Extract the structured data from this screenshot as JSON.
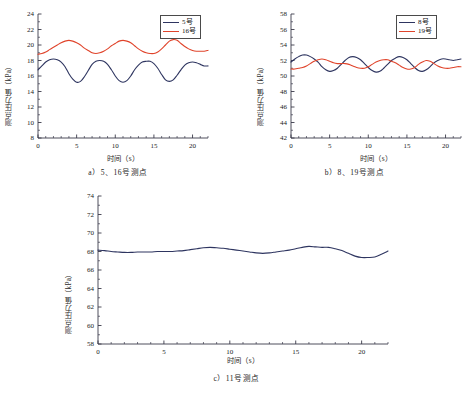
{
  "figure": {
    "ylabel": "测点压力值（kPa）",
    "xlabel": "时间（s）"
  },
  "charts": [
    {
      "id": "a",
      "caption": "a）5、16号测点",
      "ylabel": "测点压力值（kPa）",
      "xlabel": "时间（s）",
      "yticks": [
        "8",
        "10",
        "12",
        "14",
        "16",
        "18",
        "20",
        "22",
        "24"
      ],
      "xticks": [
        "0",
        "5",
        "10",
        "15",
        "20"
      ],
      "legend": [
        {
          "label": "5号",
          "color": "#2e3560"
        },
        {
          "label": "16号",
          "color": "#e0442b"
        }
      ]
    },
    {
      "id": "b",
      "caption": "b）8、19号测点",
      "ylabel": "测点压力值（kPa）",
      "xlabel": "时间（s）",
      "yticks": [
        "42",
        "44",
        "46",
        "48",
        "50",
        "52",
        "54",
        "56",
        "58"
      ],
      "xticks": [
        "0",
        "5",
        "10",
        "15",
        "20"
      ],
      "legend": [
        {
          "label": "8号",
          "color": "#2e3560"
        },
        {
          "label": "19号",
          "color": "#e0442b"
        }
      ]
    },
    {
      "id": "c",
      "caption": "c）11号测点",
      "ylabel": "测点压力值（kPa）",
      "xlabel": "时间（s）",
      "yticks": [
        "58",
        "60",
        "62",
        "64",
        "66",
        "68",
        "70",
        "72",
        "74"
      ],
      "xticks": [
        "0",
        "5",
        "10",
        "15",
        "20"
      ],
      "legend": []
    }
  ],
  "chart_data": [
    {
      "type": "line",
      "id": "a",
      "title": "a）5、16号测点",
      "xlabel": "时间（s）",
      "ylabel": "测点压力值（kPa）",
      "xlim": [
        0,
        22
      ],
      "ylim": [
        8,
        24
      ],
      "ytick_step": 2,
      "xticks": [
        0,
        5,
        10,
        15,
        20
      ],
      "grid": false,
      "legend_position": "top-right",
      "x": [
        0,
        0.5,
        1,
        1.5,
        2,
        2.5,
        3,
        3.5,
        4,
        4.5,
        5,
        5.5,
        6,
        6.5,
        7,
        7.5,
        8,
        8.5,
        9,
        9.5,
        10,
        10.5,
        11,
        11.5,
        12,
        12.5,
        13,
        13.5,
        14,
        14.5,
        15,
        15.5,
        16,
        16.5,
        17,
        17.5,
        18,
        18.5,
        19,
        19.5,
        20,
        20.5,
        21,
        21.5,
        22
      ],
      "series": [
        {
          "name": "5号",
          "color": "#2e3560",
          "values": [
            16.8,
            17.3,
            17.8,
            18.1,
            18.2,
            18.1,
            17.8,
            17.2,
            16.3,
            15.6,
            15.2,
            15.3,
            15.9,
            16.7,
            17.5,
            17.9,
            18.0,
            17.9,
            17.5,
            16.8,
            16.0,
            15.4,
            15.2,
            15.4,
            16.0,
            16.8,
            17.4,
            17.8,
            17.9,
            17.9,
            17.6,
            17.0,
            16.2,
            15.5,
            15.3,
            15.5,
            16.1,
            16.8,
            17.4,
            17.7,
            17.8,
            17.7,
            17.5,
            17.3,
            17.3
          ]
        },
        {
          "name": "16号",
          "color": "#e0442b",
          "values": [
            18.8,
            18.9,
            19.1,
            19.4,
            19.7,
            20.0,
            20.3,
            20.5,
            20.6,
            20.5,
            20.3,
            20.0,
            19.6,
            19.3,
            19.0,
            18.9,
            19.0,
            19.2,
            19.5,
            19.9,
            20.2,
            20.5,
            20.6,
            20.5,
            20.3,
            19.9,
            19.5,
            19.2,
            19.0,
            18.9,
            18.9,
            19.1,
            19.5,
            20.0,
            20.5,
            20.7,
            20.6,
            20.2,
            19.8,
            19.5,
            19.3,
            19.2,
            19.2,
            19.2,
            19.3
          ]
        }
      ]
    },
    {
      "type": "line",
      "id": "b",
      "title": "b）8、19号测点",
      "xlabel": "时间（s）",
      "ylabel": "测点压力值（kPa）",
      "xlim": [
        0,
        22
      ],
      "ylim": [
        42,
        58
      ],
      "ytick_step": 2,
      "xticks": [
        0,
        5,
        10,
        15,
        20
      ],
      "grid": false,
      "legend_position": "top-right",
      "x": [
        0,
        0.5,
        1,
        1.5,
        2,
        2.5,
        3,
        3.5,
        4,
        4.5,
        5,
        5.5,
        6,
        6.5,
        7,
        7.5,
        8,
        8.5,
        9,
        9.5,
        10,
        10.5,
        11,
        11.5,
        12,
        12.5,
        13,
        13.5,
        14,
        14.5,
        15,
        15.5,
        16,
        16.5,
        17,
        17.5,
        18,
        18.5,
        19,
        19.5,
        20,
        20.5,
        21,
        21.5,
        22
      ],
      "series": [
        {
          "name": "8号",
          "color": "#2e3560",
          "values": [
            51.8,
            52.2,
            52.5,
            52.7,
            52.7,
            52.5,
            52.2,
            51.8,
            51.2,
            50.8,
            50.6,
            50.7,
            51.0,
            51.5,
            52.0,
            52.4,
            52.5,
            52.4,
            52.1,
            51.6,
            51.1,
            50.7,
            50.5,
            50.6,
            51.0,
            51.5,
            52.0,
            52.3,
            52.5,
            52.4,
            52.1,
            51.6,
            51.1,
            50.7,
            50.6,
            50.8,
            51.2,
            51.7,
            52.0,
            52.2,
            52.2,
            52.1,
            52.0,
            52.1,
            52.2
          ]
        },
        {
          "name": "19号",
          "color": "#e0442b",
          "values": [
            50.9,
            50.9,
            51.0,
            51.1,
            51.3,
            51.6,
            51.9,
            52.1,
            52.2,
            52.1,
            51.9,
            51.7,
            51.6,
            51.6,
            51.6,
            51.5,
            51.3,
            51.1,
            51.0,
            51.0,
            51.2,
            51.5,
            51.8,
            52.0,
            52.1,
            52.1,
            51.9,
            51.7,
            51.4,
            51.1,
            50.9,
            50.9,
            51.1,
            51.5,
            51.8,
            52.0,
            51.9,
            51.6,
            51.3,
            51.1,
            51.0,
            51.0,
            51.1,
            51.2,
            51.2
          ]
        }
      ]
    },
    {
      "type": "line",
      "id": "c",
      "title": "c）11号测点",
      "xlabel": "时间（s）",
      "ylabel": "测点压力值（kPa）",
      "xlim": [
        0,
        22
      ],
      "ylim": [
        58,
        74
      ],
      "ytick_step": 2,
      "xticks": [
        0,
        5,
        10,
        15,
        20
      ],
      "grid": false,
      "legend_position": "none",
      "x": [
        0,
        0.5,
        1,
        1.5,
        2,
        2.5,
        3,
        3.5,
        4,
        4.5,
        5,
        5.5,
        6,
        6.5,
        7,
        7.5,
        8,
        8.5,
        9,
        9.5,
        10,
        10.5,
        11,
        11.5,
        12,
        12.5,
        13,
        13.5,
        14,
        14.5,
        15,
        15.5,
        16,
        16.5,
        17,
        17.5,
        18,
        18.5,
        19,
        19.5,
        20,
        20.5,
        21,
        21.5,
        22
      ],
      "series": [
        {
          "name": "11号",
          "color": "#2e3560",
          "values": [
            68.15,
            68.1,
            68.0,
            67.95,
            67.9,
            67.9,
            67.95,
            67.95,
            67.95,
            68.0,
            68.0,
            68.0,
            68.05,
            68.1,
            68.2,
            68.3,
            68.4,
            68.45,
            68.4,
            68.35,
            68.25,
            68.15,
            68.05,
            67.95,
            67.85,
            67.8,
            67.85,
            67.95,
            68.05,
            68.15,
            68.3,
            68.45,
            68.55,
            68.5,
            68.45,
            68.45,
            68.3,
            68.1,
            67.8,
            67.5,
            67.35,
            67.35,
            67.4,
            67.7,
            68.05
          ]
        }
      ]
    }
  ]
}
